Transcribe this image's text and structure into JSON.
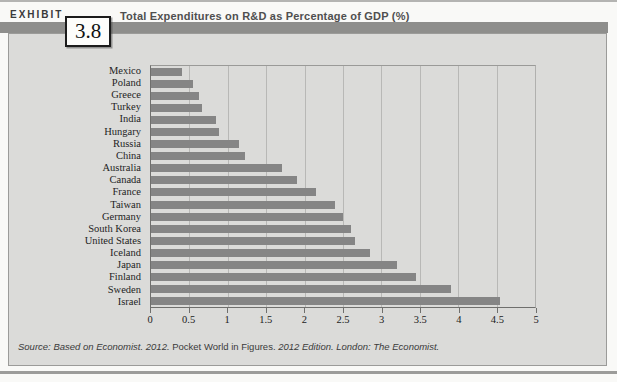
{
  "exhibit": {
    "label": "EXHIBIT",
    "number": "3.8"
  },
  "title": "Total Expenditures on R&D as Percentage of GDP (%)",
  "source": {
    "part1": "Source: Based on Economist. 2012. ",
    "part2": "Pocket World in Figures. ",
    "part3": "2012 Edition. London: The Economist."
  },
  "colors": {
    "bar": "#858585",
    "panel_background": "#dbdbd9",
    "header_band": "#8e8e8c",
    "gridline": "#b8b8b6"
  },
  "chart_data": {
    "type": "bar",
    "orientation": "horizontal",
    "title": "Total Expenditures on R&D as Percentage of GDP (%)",
    "xlabel": "",
    "ylabel": "",
    "xlim": [
      0,
      5
    ],
    "grid": true,
    "bar_color": "#858585",
    "categories": [
      "Mexico",
      "Poland",
      "Greece",
      "Turkey",
      "India",
      "Hungary",
      "Russia",
      "China",
      "Australia",
      "Canada",
      "France",
      "Taiwan",
      "Germany",
      "South Korea",
      "United States",
      "Iceland",
      "Japan",
      "Finland",
      "Sweden",
      "Israel"
    ],
    "values": [
      0.4,
      0.55,
      0.62,
      0.67,
      0.85,
      0.88,
      1.15,
      1.23,
      1.7,
      1.9,
      2.15,
      2.4,
      2.5,
      2.6,
      2.65,
      2.85,
      3.2,
      3.45,
      3.9,
      4.55
    ],
    "xtick_labels": [
      "0",
      "0.5",
      "1",
      "1.5",
      "2",
      "2.5",
      "3",
      "3.5",
      "4",
      "4.5",
      "5"
    ]
  }
}
